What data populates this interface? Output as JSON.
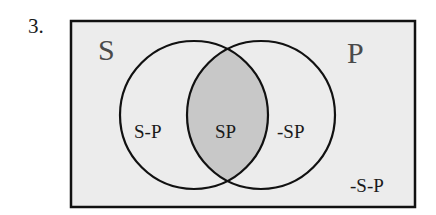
{
  "problem_number": "3.",
  "diagram": {
    "type": "venn",
    "universe_label_left": "S",
    "universe_label_right": "P",
    "regions": {
      "s_only": "S-P",
      "intersection": "SP",
      "p_only": "-SP",
      "outside": "-S-P"
    },
    "shaded_region": "intersection",
    "colors": {
      "background": "#ececec",
      "shaded": "#c8c8c8",
      "stroke": "#111111"
    }
  }
}
